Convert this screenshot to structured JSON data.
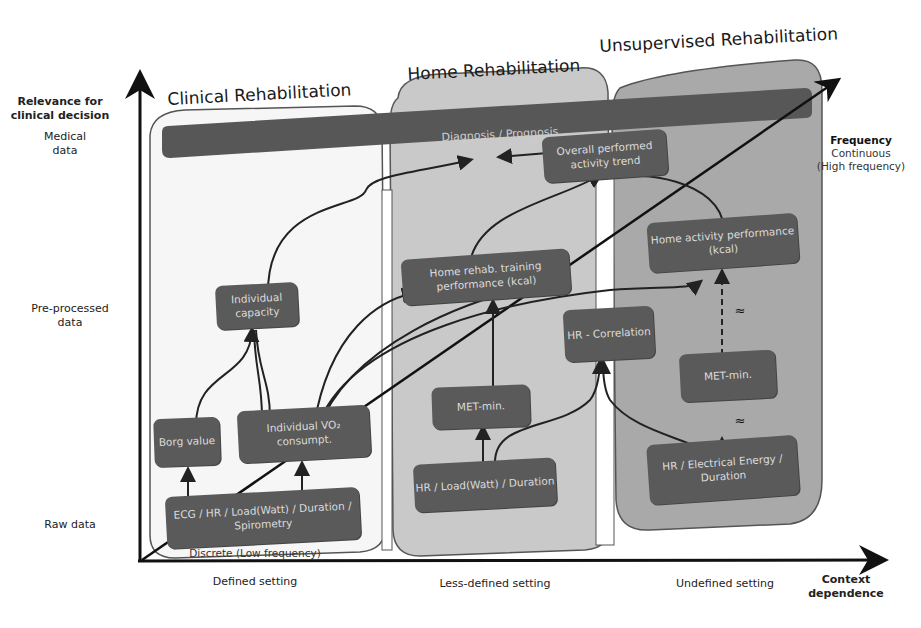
{
  "figure": {
    "y_axis": {
      "title": "Relevance for clinical decision",
      "levels": [
        "Medical data",
        "Pre-processed data",
        "Raw data"
      ]
    },
    "x_axis": {
      "title": "Context dependence",
      "levels": [
        "Defined setting",
        "Less-defined setting",
        "Undefined setting"
      ]
    },
    "diagonal_axis": {
      "title": "Frequency",
      "high_label": "Continuous",
      "high_sub": "(High frequency)",
      "low_label": "Discrete (Low frequency)"
    },
    "panels": [
      {
        "title": "Clinical Rehabilitation",
        "fill": "#f4f4f4"
      },
      {
        "title": "Home Rehabilitation",
        "fill": "#c9c9c9"
      },
      {
        "title": "Unsupervised Rehabilitation",
        "fill": "#a9a9a9"
      }
    ],
    "banner": {
      "label": "Diagnosis / Prognosis",
      "fill": "#575757"
    },
    "nodes": {
      "individual_capacity": "Individual capacity",
      "borg_value": "Borg value",
      "individual_vo2": "Individual VO₂ consumpt.",
      "ecg_raw": "ECG / HR / Load(Watt) / Duration / Spirometry",
      "overall_trend": "Overall performed activity trend",
      "home_rehab_training": "Home rehab. training performance (kcal)",
      "met_min_home": "MET-min.",
      "hr_load_duration": "HR / Load(Watt) / Duration",
      "hr_correlation": "HR - Correlation",
      "home_activity": "Home activity performance (kcal)",
      "met_min_unsup": "MET-min.",
      "hr_electrical": "HR / Electrical Energy / Duration"
    },
    "approx_symbol": "≈",
    "colors": {
      "node": "#5a5a5a",
      "node_text": "#dcdcdc",
      "axis": "#111111"
    }
  }
}
